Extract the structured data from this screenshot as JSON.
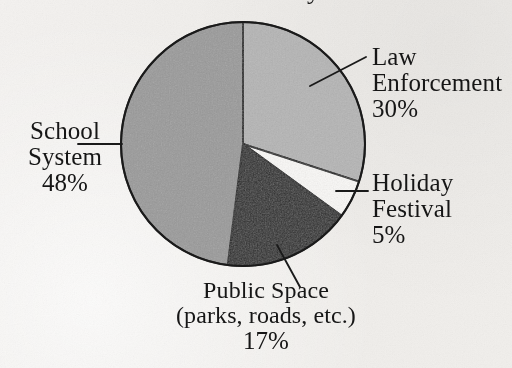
{
  "figure": {
    "kind": "scanned-pie-chart",
    "background_color": "#f2f0ee",
    "title_cropped": "Where the Money Goes",
    "outline_color": "#1a1a1a"
  },
  "labels": {
    "law": {
      "line1": "Law",
      "line2": "Enforcement",
      "pct": "30%"
    },
    "holiday": {
      "line1": "Holiday",
      "line2": "Festival",
      "pct": "5%"
    },
    "school": {
      "line1": "School",
      "line2": "System",
      "pct": "48%"
    },
    "public": {
      "line1": "Public Space",
      "line2": "(parks, roads, etc.)",
      "pct": "17%"
    }
  },
  "chart_data": {
    "type": "pie",
    "title": "",
    "xlabel": "",
    "ylabel": "",
    "start_angle_deg": 0,
    "direction": "clockwise",
    "center": [
      243,
      144
    ],
    "radius": 122,
    "legend_position": "callout-labels",
    "grid": false,
    "categories": [
      "Law Enforcement",
      "Holiday Festival",
      "Public Space (parks, roads, etc.)",
      "School System"
    ],
    "values": [
      30,
      5,
      17,
      48
    ],
    "value_labels": [
      "30%",
      "5%",
      "17%",
      "48%"
    ],
    "units": "percent",
    "total": 100,
    "slices": [
      {
        "name": "Law Enforcement",
        "value": 30,
        "label": "30%",
        "color": "#b6b6b6",
        "start_deg": 0,
        "end_deg": 108
      },
      {
        "name": "Holiday Festival",
        "value": 5,
        "label": "5%",
        "color": "#fbfaf8",
        "start_deg": 108,
        "end_deg": 126
      },
      {
        "name": "Public Space (parks, roads, etc.)",
        "value": 17,
        "label": "17%",
        "color": "#2a2a2a",
        "start_deg": 126,
        "end_deg": 187.2
      },
      {
        "name": "School System",
        "value": 48,
        "label": "48%",
        "color": "#9b9b9b",
        "start_deg": 187.2,
        "end_deg": 360
      }
    ]
  }
}
